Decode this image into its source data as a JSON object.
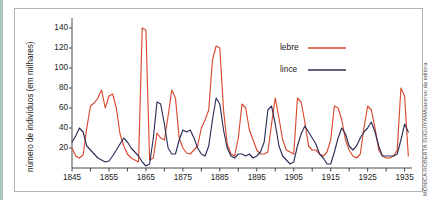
{
  "figure": {
    "credit": "MÔNICA ROBERTA SUGUIYAMA/acervo da editora",
    "frame_color": "#b4b4b4",
    "background": "#ffffff"
  },
  "legend": {
    "position": "top-right-inside",
    "entries": [
      {
        "label": "lebre",
        "color": "#d9492f"
      },
      {
        "label": "lince",
        "color": "#2b2f58"
      }
    ]
  },
  "chart_data": {
    "type": "line",
    "title": "",
    "xlabel": "",
    "ylabel": "número de indivíduos (em milhares)",
    "xlim": [
      1845,
      1937
    ],
    "ylim": [
      0,
      150
    ],
    "grid": false,
    "yticks": [
      20,
      40,
      60,
      80,
      100,
      120,
      140
    ],
    "ytick_labels": [
      "20",
      "40",
      "60",
      "80",
      "100",
      "120",
      "140"
    ],
    "xticks": [
      1845,
      1855,
      1865,
      1875,
      1885,
      1895,
      1905,
      1915,
      1925,
      1935
    ],
    "xtick_labels": [
      "1845",
      "1855",
      "1865",
      "1875",
      "1885",
      "1895",
      "1905",
      "1915",
      "1925",
      "1935"
    ],
    "xminor_step": 5,
    "x": [
      1845,
      1846,
      1847,
      1848,
      1849,
      1850,
      1851,
      1852,
      1853,
      1854,
      1855,
      1856,
      1857,
      1858,
      1859,
      1860,
      1861,
      1862,
      1863,
      1864,
      1865,
      1866,
      1867,
      1868,
      1869,
      1870,
      1871,
      1872,
      1873,
      1874,
      1875,
      1876,
      1877,
      1878,
      1879,
      1880,
      1881,
      1882,
      1883,
      1884,
      1885,
      1886,
      1887,
      1888,
      1889,
      1890,
      1891,
      1892,
      1893,
      1894,
      1895,
      1896,
      1897,
      1898,
      1899,
      1900,
      1901,
      1902,
      1903,
      1904,
      1905,
      1906,
      1907,
      1908,
      1909,
      1910,
      1911,
      1912,
      1913,
      1914,
      1915,
      1916,
      1917,
      1918,
      1919,
      1920,
      1921,
      1922,
      1923,
      1924,
      1925,
      1926,
      1927,
      1928,
      1929,
      1930,
      1931,
      1932,
      1933,
      1934,
      1935,
      1936
    ],
    "series": [
      {
        "name": "lebre",
        "color": "#d9492f",
        "values": [
          20,
          12,
          10,
          13,
          40,
          62,
          65,
          70,
          78,
          60,
          72,
          74,
          60,
          34,
          22,
          14,
          10,
          8,
          6,
          140,
          138,
          8,
          10,
          35,
          30,
          28,
          52,
          78,
          70,
          30,
          20,
          15,
          14,
          18,
          22,
          40,
          48,
          58,
          108,
          122,
          120,
          58,
          24,
          14,
          12,
          30,
          64,
          60,
          38,
          28,
          18,
          14,
          14,
          16,
          44,
          70,
          50,
          28,
          18,
          16,
          14,
          70,
          66,
          46,
          22,
          18,
          18,
          14,
          12,
          16,
          28,
          62,
          60,
          48,
          28,
          18,
          12,
          10,
          14,
          40,
          62,
          58,
          40,
          18,
          12,
          10,
          10,
          12,
          18,
          80,
          72,
          12
        ]
      },
      {
        "name": "lince",
        "color": "#2b2f58",
        "values": [
          26,
          32,
          40,
          36,
          22,
          18,
          14,
          10,
          8,
          6,
          7,
          12,
          18,
          24,
          30,
          26,
          20,
          16,
          12,
          6,
          2,
          4,
          30,
          66,
          64,
          44,
          20,
          14,
          14,
          28,
          38,
          36,
          38,
          30,
          20,
          14,
          12,
          22,
          48,
          70,
          64,
          38,
          20,
          12,
          10,
          14,
          14,
          12,
          14,
          10,
          12,
          16,
          26,
          58,
          62,
          44,
          22,
          12,
          8,
          4,
          6,
          22,
          34,
          42,
          36,
          30,
          24,
          14,
          10,
          4,
          4,
          16,
          30,
          40,
          34,
          22,
          18,
          22,
          30,
          36,
          40,
          46,
          36,
          22,
          12,
          12,
          12,
          12,
          14,
          28,
          44,
          36
        ]
      }
    ]
  }
}
